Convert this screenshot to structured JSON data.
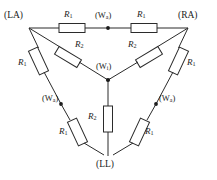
{
  "figure": {
    "kind": "resistor-network-schematic",
    "wire_color": "#2b2b2b",
    "background_color": "#ffffff",
    "label_color": "#1b1b1b"
  },
  "terminals": [
    {
      "id": "LA",
      "label": "(LA)",
      "x": 22,
      "y": 18
    },
    {
      "id": "RA",
      "label": "(RA)",
      "x": 194,
      "y": 18
    },
    {
      "id": "LL",
      "label": "(LL)",
      "x": 108,
      "y": 162
    }
  ],
  "taps": [
    {
      "id": "Wa-top",
      "label": "(W",
      "subscript": "a",
      "suffix": ")",
      "x": 108,
      "y": 21
    },
    {
      "id": "Wa-left",
      "label": "(W",
      "subscript": "a",
      "suffix": ")",
      "x": 65,
      "y": 96
    },
    {
      "id": "Wa-right",
      "label": "(W",
      "subscript": "a",
      "suffix": ")",
      "x": 150,
      "y": 96
    },
    {
      "id": "Wi-center",
      "label": "(W",
      "subscript": "i",
      "suffix": ")",
      "x": 108,
      "y": 80
    }
  ],
  "resistors": [
    {
      "id": "r-top-left",
      "label": "R",
      "subscript": "1",
      "orientation": "horizontal"
    },
    {
      "id": "r-top-right",
      "label": "R",
      "subscript": "1",
      "orientation": "horizontal"
    },
    {
      "id": "r-left-upper",
      "label": "R",
      "subscript": "1",
      "orientation": "diagonal"
    },
    {
      "id": "r-left-lower",
      "label": "R",
      "subscript": "1",
      "orientation": "diagonal"
    },
    {
      "id": "r-right-upper",
      "label": "R",
      "subscript": "1",
      "orientation": "diagonal"
    },
    {
      "id": "r-right-lower",
      "label": "R",
      "subscript": "1",
      "orientation": "diagonal"
    },
    {
      "id": "r-center-left",
      "label": "R",
      "subscript": "2",
      "orientation": "diagonal"
    },
    {
      "id": "r-center-right",
      "label": "R",
      "subscript": "2",
      "orientation": "diagonal"
    },
    {
      "id": "r-center-down",
      "label": "R",
      "subscript": "2",
      "orientation": "vertical"
    }
  ],
  "resistor_labels": {
    "top_left": {
      "text": "R",
      "sub": "1",
      "x": 63,
      "y": 15
    },
    "top_right": {
      "text": "R",
      "sub": "1",
      "x": 140,
      "y": 15
    },
    "left_upper": {
      "text": "R",
      "sub": "1",
      "x": 22,
      "y": 64
    },
    "left_lower": {
      "text": "R",
      "sub": "1",
      "x": 66,
      "y": 124
    },
    "right_upper": {
      "text": "R",
      "sub": "1",
      "x": 180,
      "y": 64
    },
    "right_lower": {
      "text": "R",
      "sub": "1",
      "x": 135,
      "y": 124
    },
    "center_left": {
      "text": "R",
      "sub": "2",
      "x": 75,
      "y": 46
    },
    "center_right": {
      "text": "R",
      "sub": "2",
      "x": 125,
      "y": 46
    },
    "center_down": {
      "text": "R",
      "sub": "2",
      "x": 92,
      "y": 113
    }
  }
}
